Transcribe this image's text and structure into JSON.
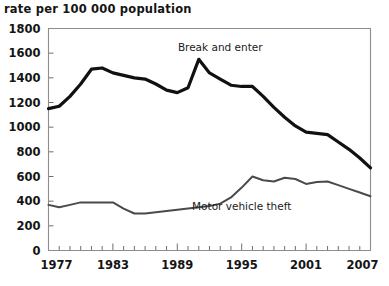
{
  "chart_data": {
    "type": "line",
    "title": "rate per 100 000 population",
    "xlabel": "",
    "ylabel": "rate per 100 000 population",
    "xlim": [
      1977,
      2007
    ],
    "ylim": [
      0,
      1800
    ],
    "ytick_step": 200,
    "yticks": [
      0,
      200,
      400,
      600,
      800,
      1000,
      1200,
      1400,
      1600,
      1800
    ],
    "xticks_labeled": [
      1977,
      1983,
      1989,
      1995,
      2001,
      2007
    ],
    "xticks_all": [
      1977,
      1978,
      1979,
      1980,
      1981,
      1982,
      1983,
      1984,
      1985,
      1986,
      1987,
      1988,
      1989,
      1990,
      1991,
      1992,
      1993,
      1994,
      1995,
      1996,
      1997,
      1998,
      1999,
      2000,
      2001,
      2002,
      2003,
      2004,
      2005,
      2006,
      2007
    ],
    "grid": false,
    "legend_position": "inline-annotations",
    "x": [
      1977,
      1978,
      1979,
      1980,
      1981,
      1982,
      1983,
      1984,
      1985,
      1986,
      1987,
      1988,
      1989,
      1990,
      1991,
      1992,
      1993,
      1994,
      1995,
      1996,
      1997,
      1998,
      1999,
      2000,
      2001,
      2002,
      2003,
      2004,
      2005,
      2006,
      2007
    ],
    "series": [
      {
        "name": "Break and enter",
        "color": "#111111",
        "line_width": 3.2,
        "label_x": 1993,
        "label_y": 1620,
        "values": [
          1150,
          1170,
          1250,
          1350,
          1470,
          1480,
          1440,
          1420,
          1400,
          1390,
          1350,
          1300,
          1280,
          1320,
          1550,
          1440,
          1390,
          1340,
          1330,
          1330,
          1250,
          1160,
          1080,
          1010,
          960,
          950,
          940,
          880,
          820,
          750,
          670
        ]
      },
      {
        "name": "Motor vehicle theft",
        "color": "#4a4a4a",
        "line_width": 2.0,
        "label_x": 1995,
        "label_y": 330,
        "values": [
          370,
          350,
          370,
          390,
          390,
          390,
          390,
          340,
          300,
          300,
          310,
          320,
          330,
          340,
          350,
          360,
          380,
          430,
          510,
          600,
          570,
          560,
          590,
          580,
          540,
          555,
          560,
          530,
          500,
          470,
          440
        ]
      }
    ],
    "annotations": [
      {
        "text": "Break and enter",
        "x": 1993,
        "y": 1620
      },
      {
        "text": "Motor vehicle theft",
        "x": 1995,
        "y": 330
      }
    ]
  },
  "axis_title": "rate per 100 000 population",
  "y_labels": [
    "1800",
    "1600",
    "1400",
    "1200",
    "1000",
    "800",
    "600",
    "400",
    "200",
    "0"
  ],
  "x_labels": [
    "1977",
    "1983",
    "1989",
    "1995",
    "2001",
    "2007"
  ],
  "series_labels": {
    "break_and_enter": "Break and enter",
    "motor_vehicle_theft": "Motor vehicle theft"
  },
  "colors": {
    "break_and_enter": "#111111",
    "motor_vehicle_theft": "#4a4a4a",
    "frame": "#8d8d8d",
    "text": "#141414",
    "background": "#ffffff"
  }
}
